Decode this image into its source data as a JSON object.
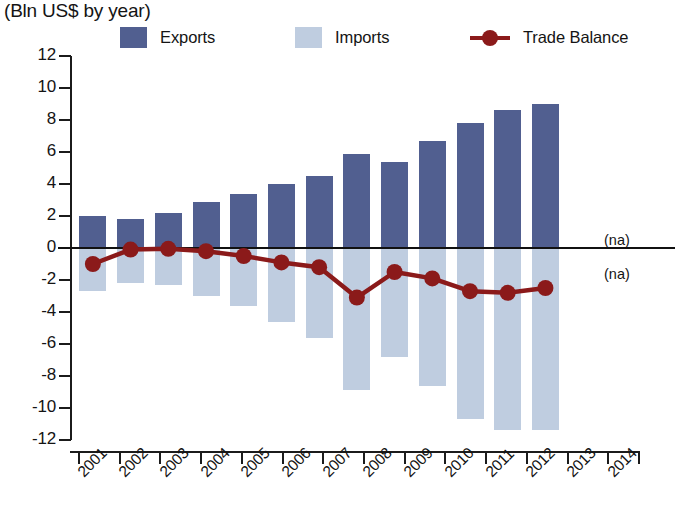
{
  "subtitle": "(Bln US$ by year)",
  "colors": {
    "exports": "#515f90",
    "imports": "#bfcde0",
    "trade_balance": "#8b1a1a",
    "axis": "#1b1b1b",
    "text": "#141414"
  },
  "legend": [
    {
      "label": "Exports",
      "marker": "square",
      "color": "#515f90"
    },
    {
      "label": "Imports",
      "marker": "square",
      "color": "#bfcde0"
    },
    {
      "label": "Trade Balance",
      "marker": "line-dot",
      "color": "#8b1a1a"
    }
  ],
  "annotations": [
    {
      "text": "(na)",
      "note": "exports not available for 2014"
    },
    {
      "text": "(na)",
      "note": "imports not available for 2014"
    }
  ],
  "chart_data": {
    "type": "bar",
    "title": "",
    "subtitle": "(Bln US$ by year)",
    "xlabel": "",
    "ylabel": "",
    "ylim": [
      -12,
      12
    ],
    "yticks": [
      12,
      10,
      8,
      6,
      4,
      2,
      0,
      -2,
      -4,
      -6,
      -8,
      -10,
      -12
    ],
    "ytick_labels": [
      "12",
      "10",
      "8",
      "6",
      "4",
      "2",
      "0",
      "-2",
      "-4",
      "-6",
      "-8",
      "-10",
      "-12"
    ],
    "grid": false,
    "legend_position": "top",
    "categories": [
      "2001",
      "2002",
      "2003",
      "2004",
      "2005",
      "2006",
      "2007",
      "2008",
      "2009",
      "2010",
      "2011",
      "2012",
      "2013",
      "2014"
    ],
    "series": [
      {
        "name": "Exports",
        "type": "bar",
        "color": "#515f90",
        "values": [
          2.0,
          1.8,
          2.2,
          2.9,
          3.4,
          4.0,
          4.5,
          5.9,
          5.4,
          6.7,
          7.8,
          8.6,
          9.0,
          null
        ]
      },
      {
        "name": "Imports",
        "type": "bar",
        "color": "#bfcde0",
        "values": [
          -2.7,
          -2.2,
          -2.3,
          -3.0,
          -3.6,
          -4.6,
          -5.6,
          -8.9,
          -6.8,
          -8.6,
          -10.7,
          -11.4,
          -11.4,
          null
        ]
      },
      {
        "name": "Trade Balance",
        "type": "line",
        "color": "#8b1a1a",
        "values": [
          -1.0,
          -0.1,
          -0.05,
          -0.2,
          -0.5,
          -0.9,
          -1.2,
          -3.1,
          -1.5,
          -1.9,
          -2.7,
          -2.8,
          -2.5,
          null
        ]
      }
    ]
  }
}
